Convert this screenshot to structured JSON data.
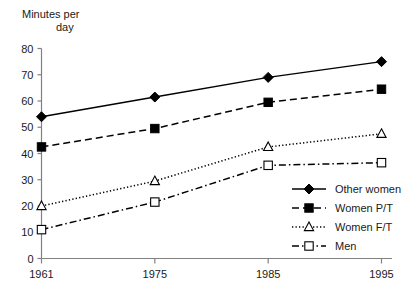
{
  "chart_data": {
    "type": "line",
    "title": "",
    "subtitle": "",
    "ylabel_line1": "Minutes per",
    "ylabel_line2": "day",
    "ylabel": "Minutes per day",
    "xlabel": "",
    "categories": [
      "1961",
      "1975",
      "1985",
      "1995"
    ],
    "x": [
      1961,
      1975,
      1985,
      1995
    ],
    "ylim": [
      0,
      80
    ],
    "yticks": [
      "0",
      "10",
      "20",
      "30",
      "40",
      "50",
      "60",
      "70",
      "80"
    ],
    "ytick_values": [
      0,
      10,
      20,
      30,
      40,
      50,
      60,
      70,
      80
    ],
    "grid": false,
    "legend_position": "inside-bottom-right",
    "series": [
      {
        "name": "Other women",
        "values": [
          54,
          61.5,
          69,
          75
        ],
        "line_style": "solid",
        "marker": "filled-diamond",
        "color": "#000000"
      },
      {
        "name": "Women P/T",
        "values": [
          42.5,
          49.5,
          59.5,
          64.5
        ],
        "line_style": "dashed",
        "marker": "filled-square",
        "color": "#000000"
      },
      {
        "name": "Women F/T",
        "values": [
          20,
          29.5,
          42.5,
          47.5
        ],
        "line_style": "dotted",
        "marker": "open-triangle",
        "color": "#000000"
      },
      {
        "name": "Men",
        "values": [
          11,
          21.5,
          35.5,
          36.5
        ],
        "line_style": "dash-dot",
        "marker": "open-square",
        "color": "#000000"
      }
    ],
    "axis_color": "#808080",
    "plot_color": "#000000",
    "background": "#ffffff"
  },
  "legend": {
    "items": [
      {
        "label": "Other women"
      },
      {
        "label": "Women P/T"
      },
      {
        "label": "Women F/T"
      },
      {
        "label": "Men"
      }
    ]
  }
}
